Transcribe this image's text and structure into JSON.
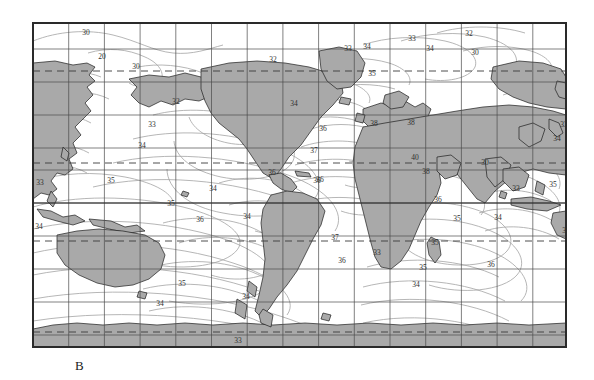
{
  "figure": {
    "panel_label": "B",
    "type": "world-map-contour",
    "map_box": {
      "x": 32,
      "y": 22,
      "width": 535,
      "height": 326
    }
  },
  "colors": {
    "land_fill": "#a9a9a9",
    "land_stroke": "#1c1c1c",
    "ocean_fill": "#ffffff",
    "graticule": "#4a4a4a",
    "graticule_major": "#2a2a2a",
    "contour": "#9a9a9a",
    "dashed_line": "#3a3a3a",
    "frame": "#2a2a2a",
    "label_text": "#2f2f2f"
  },
  "graticule": {
    "vertical_count": 15,
    "horizontal_count": 10,
    "spacing_x_px": 35.7,
    "spacing_y_px": 32.6,
    "dashed_latitudes_px": [
      70,
      162,
      240,
      331
    ],
    "dashed_labels": [
      "Arctic Circle",
      "Tropic of Cancer",
      "Tropic of Capricorn",
      "Antarctic Circle"
    ],
    "equator_y_px": 202
  },
  "chart_data": {
    "type": "contour-map",
    "title": "",
    "xlabel": "",
    "ylabel": "",
    "unit": "practical salinity units (ppt)",
    "contour_values": [
      30,
      32,
      33,
      34,
      35,
      36,
      37,
      38,
      40
    ],
    "labels": [
      {
        "text": "30",
        "x": 85,
        "y": 32
      },
      {
        "text": "20",
        "x": 101,
        "y": 56
      },
      {
        "text": "30",
        "x": 135,
        "y": 66
      },
      {
        "text": "32",
        "x": 272,
        "y": 59
      },
      {
        "text": "33",
        "x": 347,
        "y": 48
      },
      {
        "text": "34",
        "x": 366,
        "y": 46
      },
      {
        "text": "33",
        "x": 411,
        "y": 38
      },
      {
        "text": "34",
        "x": 429,
        "y": 48
      },
      {
        "text": "32",
        "x": 468,
        "y": 33
      },
      {
        "text": "30",
        "x": 474,
        "y": 52
      },
      {
        "text": "35",
        "x": 371,
        "y": 73
      },
      {
        "text": "32",
        "x": 175,
        "y": 101
      },
      {
        "text": "34",
        "x": 293,
        "y": 103
      },
      {
        "text": "33",
        "x": 151,
        "y": 124
      },
      {
        "text": "36",
        "x": 322,
        "y": 128
      },
      {
        "text": "38",
        "x": 373,
        "y": 123
      },
      {
        "text": "38",
        "x": 410,
        "y": 122
      },
      {
        "text": "33",
        "x": 563,
        "y": 124
      },
      {
        "text": "34",
        "x": 141,
        "y": 145
      },
      {
        "text": "37",
        "x": 313,
        "y": 150
      },
      {
        "text": "34",
        "x": 556,
        "y": 138
      },
      {
        "text": "36",
        "x": 271,
        "y": 172
      },
      {
        "text": "40",
        "x": 414,
        "y": 157
      },
      {
        "text": "36",
        "x": 316,
        "y": 180
      },
      {
        "text": "38",
        "x": 425,
        "y": 171
      },
      {
        "text": "30",
        "x": 484,
        "y": 162
      },
      {
        "text": "33",
        "x": 39,
        "y": 182
      },
      {
        "text": "35",
        "x": 110,
        "y": 180
      },
      {
        "text": "34",
        "x": 212,
        "y": 188
      },
      {
        "text": "36",
        "x": 319,
        "y": 179
      },
      {
        "text": "33",
        "x": 515,
        "y": 188
      },
      {
        "text": "35",
        "x": 552,
        "y": 184
      },
      {
        "text": "35",
        "x": 170,
        "y": 203
      },
      {
        "text": "36",
        "x": 199,
        "y": 219
      },
      {
        "text": "36",
        "x": 437,
        "y": 199
      },
      {
        "text": "35",
        "x": 456,
        "y": 218
      },
      {
        "text": "34",
        "x": 497,
        "y": 217
      },
      {
        "text": "34",
        "x": 38,
        "y": 226
      },
      {
        "text": "34",
        "x": 246,
        "y": 216
      },
      {
        "text": "35",
        "x": 565,
        "y": 230
      },
      {
        "text": "33",
        "x": 376,
        "y": 252
      },
      {
        "text": "37",
        "x": 334,
        "y": 237
      },
      {
        "text": "35",
        "x": 434,
        "y": 242
      },
      {
        "text": "36",
        "x": 341,
        "y": 260
      },
      {
        "text": "35",
        "x": 422,
        "y": 267
      },
      {
        "text": "36",
        "x": 490,
        "y": 264
      },
      {
        "text": "34",
        "x": 415,
        "y": 284
      },
      {
        "text": "35",
        "x": 181,
        "y": 283
      },
      {
        "text": "34",
        "x": 159,
        "y": 303
      },
      {
        "text": "34",
        "x": 245,
        "y": 296
      },
      {
        "text": "33",
        "x": 237,
        "y": 340
      }
    ]
  }
}
